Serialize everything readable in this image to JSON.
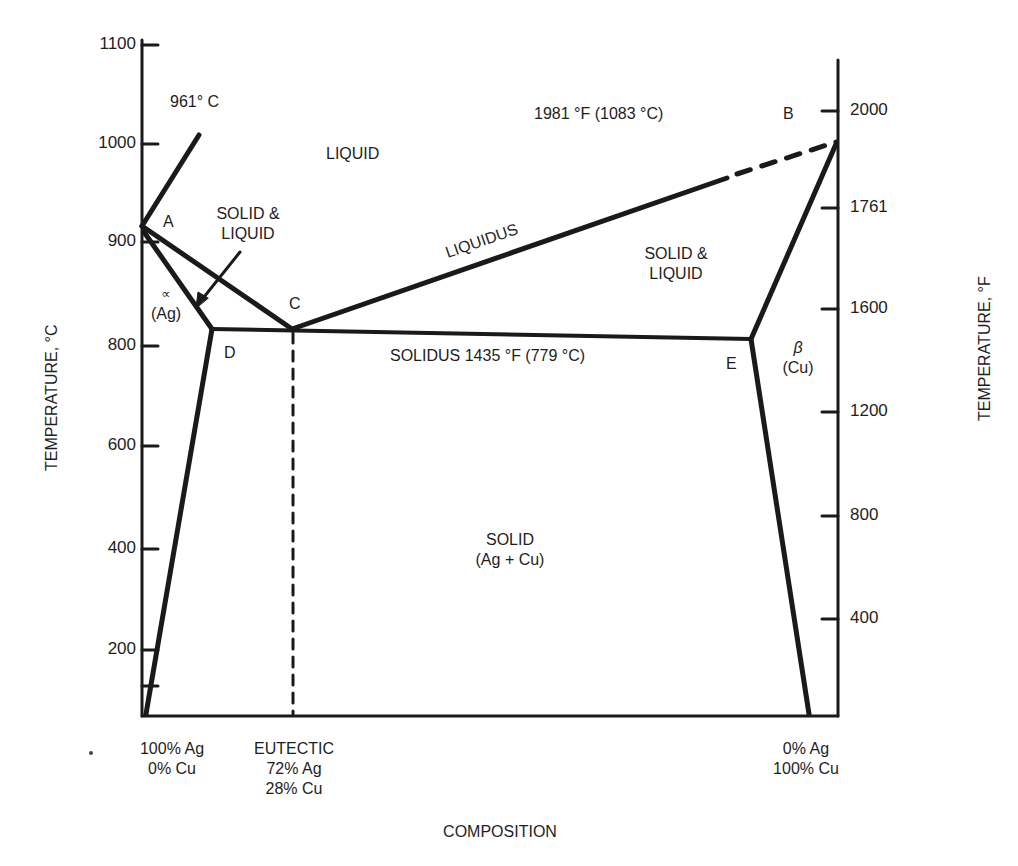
{
  "chart_data": {
    "type": "phase-diagram",
    "title": "",
    "xlabel": "COMPOSITION",
    "ylabel_left": "TEMPERATURE, °C",
    "ylabel_right": "TEMPERATURE, °F",
    "left_axis": {
      "ticks": [
        {
          "label": "1100",
          "y": 45
        },
        {
          "label": "1000",
          "y": 144
        },
        {
          "label": "900",
          "y": 242
        },
        {
          "label": "800",
          "y": 346
        },
        {
          "label": "600",
          "y": 446
        },
        {
          "label": "400",
          "y": 549
        },
        {
          "label": "200",
          "y": 650
        },
        {
          "label": "",
          "y": 686
        }
      ]
    },
    "right_axis": {
      "ticks": [
        {
          "label": "2000",
          "y": 111
        },
        {
          "label": "1761",
          "y": 208
        },
        {
          "label": "1600",
          "y": 309
        },
        {
          "label": "1200",
          "y": 412
        },
        {
          "label": "800",
          "y": 516
        },
        {
          "label": "400",
          "y": 619
        }
      ]
    },
    "x_annotations": [
      {
        "lines": [
          "100% Ag",
          "0% Cu"
        ],
        "x": 172
      },
      {
        "lines": [
          "EUTECTIC",
          "72% Ag",
          "28% Cu"
        ],
        "x": 294
      },
      {
        "lines": [
          "0% Ag",
          "100% Cu"
        ],
        "x": 806
      }
    ],
    "points": {
      "A": {
        "label": "A",
        "temp_c": 961
      },
      "B": {
        "label": "B",
        "temp_c": 1083
      },
      "C": {
        "label": "C",
        "temp_c": 779,
        "composition": "72% Ag / 28% Cu"
      },
      "D": {
        "label": "D"
      },
      "E": {
        "label": "E"
      }
    },
    "lines": [
      {
        "name": "liquidus",
        "from": "A",
        "to": "C"
      },
      {
        "name": "liquidus",
        "from": "C",
        "to": "B",
        "partially_dashed": true
      },
      {
        "name": "solidus",
        "from": "D",
        "to": "E",
        "temp_f": 1435,
        "temp_c": 779
      },
      {
        "name": "alpha-solidus",
        "from": "A",
        "to": "D"
      },
      {
        "name": "beta-solidus",
        "from": "B",
        "to": "E"
      },
      {
        "name": "alpha-solvus",
        "from": "D",
        "to": "bottom-left"
      },
      {
        "name": "beta-solvus",
        "from": "E",
        "to": "bottom-right"
      },
      {
        "name": "eutectic-composition",
        "from": "C",
        "to": "bottom",
        "dashed": true
      }
    ],
    "regions": [
      "LIQUID",
      "SOLID & LIQUID (Ag side)",
      "SOLID & LIQUID (Cu side)",
      "α (Ag)",
      "β (Cu)",
      "SOLID (Ag + Cu)"
    ],
    "annotations": [
      "961° C",
      "1981 °F (1083 °C)",
      "LIQUIDUS",
      "SOLIDUS 1435 °F (779 °C)"
    ]
  },
  "labels": {
    "melt_ag": "961° C",
    "melt_cu": "1981 °F (1083 °C)",
    "liquid": "LIQUID",
    "solid_liquid_left_1": "SOLID &",
    "solid_liquid_left_2": "LIQUID",
    "solid_liquid_right_1": "SOLID &",
    "solid_liquid_right_2": "LIQUID",
    "liquidus": "LIQUIDUS",
    "solidus": "SOLIDUS 1435 °F (779 °C)",
    "alpha": "∝",
    "alpha_sub": "(Ag)",
    "beta": "β",
    "beta_sub": "(Cu)",
    "solid": "SOLID",
    "solid_sub": "(Ag + Cu)",
    "pt_a": "A",
    "pt_b": "B",
    "pt_c": "C",
    "pt_d": "D",
    "pt_e": "E",
    "ag_side_1": "100% Ag",
    "ag_side_2": "0% Cu",
    "eut_1": "EUTECTIC",
    "eut_2": "72% Ag",
    "eut_3": "28% Cu",
    "cu_side_1": "0% Ag",
    "cu_side_2": "100% Cu",
    "xlabel": "COMPOSITION",
    "ylabel_left": "TEMPERATURE, °C",
    "ylabel_right": "TEMPERATURE, °F"
  },
  "colors": {
    "ink": "#1a1a1a",
    "background": "#ffffff"
  }
}
